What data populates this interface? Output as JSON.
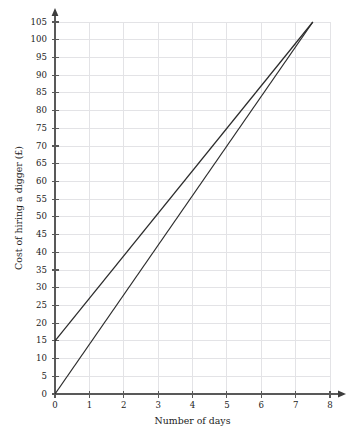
{
  "chart_data": {
    "type": "line",
    "title": "",
    "xlabel": "Number of days",
    "ylabel": "Cost of hiring a digger (£)",
    "xlim": [
      0,
      8
    ],
    "ylim": [
      0,
      105
    ],
    "grid": true,
    "legend_position": "none",
    "x_ticks": [
      0,
      1,
      2,
      3,
      4,
      5,
      6,
      7,
      8
    ],
    "x_tick_labels": [
      "0",
      "1",
      "2",
      "3",
      "4",
      "5",
      "6",
      "7",
      "8"
    ],
    "y_ticks": [
      0,
      5,
      10,
      15,
      20,
      25,
      30,
      35,
      40,
      45,
      50,
      55,
      60,
      65,
      70,
      75,
      80,
      85,
      90,
      95,
      100,
      105
    ],
    "y_tick_labels": [
      "0",
      "5",
      "10",
      "15",
      "20",
      "25",
      "30",
      "35",
      "40",
      "45",
      "50",
      "55",
      "60",
      "65",
      "70",
      "75",
      "80",
      "85",
      "90",
      "95",
      "100",
      "105"
    ],
    "series": [
      {
        "name": "Company A",
        "intercept": 0,
        "slope": 14,
        "points": [
          [
            0,
            0
          ],
          [
            7.5,
            105
          ]
        ],
        "color": "#2b2b2b"
      },
      {
        "name": "Company B",
        "intercept": 15,
        "slope": 12,
        "points": [
          [
            0,
            15
          ],
          [
            7.5,
            105
          ]
        ],
        "color": "#2b2b2b"
      }
    ],
    "intersection": [
      7.5,
      105
    ],
    "colors": {
      "grid": "#e3e3e6",
      "axis": "#595959",
      "line": "#2b2b2b",
      "background": "#ffffff",
      "text": "#1c1c1c"
    }
  },
  "geometry": {
    "plot_left": 55,
    "plot_right": 330,
    "plot_top": 22,
    "plot_bottom": 394
  }
}
